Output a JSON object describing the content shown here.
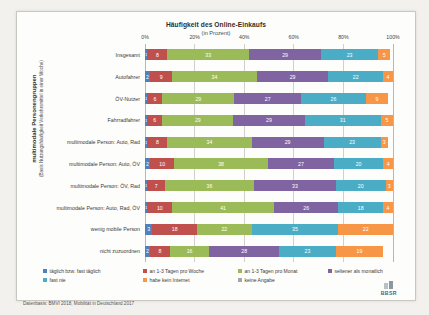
{
  "chart_data": {
    "type": "bar",
    "orientation": "horizontal",
    "stacked": true,
    "stack_unit": "percent",
    "title": "Häufigkeit des Online-Einkaufs",
    "subtitle": "(in Prozent)",
    "xlabel": "",
    "ylabel_line1": "multimodale Personengruppen",
    "ylabel_line2": "(Basis Nutzungshäufigkeit Verkehrsmittel in einer Woche)",
    "xlim": [
      0,
      100
    ],
    "xticks": [
      0,
      20,
      40,
      60,
      80,
      100
    ],
    "xticklabels": [
      "0%",
      "20%",
      "40%",
      "60%",
      "80%",
      "100%"
    ],
    "grid": true,
    "legend_position": "bottom",
    "categories": [
      "Insgesamt",
      "Autofahrer",
      "ÖV-Nutzer",
      "Fahrradfahrer",
      "multimodale Person: Auto, Rad",
      "multimodale Person: Auto, ÖV",
      "multimodale Person: ÖV, Rad",
      "multimodale Person: Auto, Rad, ÖV",
      "wenig mobile Person",
      "nicht zuzuordnen"
    ],
    "series": [
      {
        "name": "täglich bzw. fast täglich",
        "color": "#4f81bd",
        "values": [
          1,
          2,
          1,
          1,
          1,
          2,
          1,
          1,
          3,
          2
        ]
      },
      {
        "name": "an 1-3 Tagen pro Woche",
        "color": "#c0504d",
        "values": [
          8,
          9,
          6,
          6,
          8,
          10,
          7,
          10,
          18,
          8
        ]
      },
      {
        "name": "an 1-3 Tagen pro Monat",
        "color": "#9bbb59",
        "values": [
          33,
          34,
          29,
          29,
          34,
          38,
          36,
          41,
          22,
          16
        ]
      },
      {
        "name": "seltener als monatlich",
        "color": "#8064a2",
        "values": [
          29,
          29,
          27,
          29,
          29,
          27,
          33,
          26,
          0,
          28
        ]
      },
      {
        "name": "fast nie",
        "color": "#4bacc6",
        "values": [
          23,
          22,
          26,
          31,
          23,
          20,
          20,
          18,
          35,
          23
        ]
      },
      {
        "name": "habe kein Internet",
        "color": "#f79646",
        "values": [
          5,
          4,
          9,
          5,
          3,
          4,
          3,
          4,
          22,
          19
        ]
      },
      {
        "name": "keine Angabe",
        "color": "#a6a6a6",
        "values": [
          0,
          0,
          0,
          0,
          0,
          0,
          0,
          0,
          0,
          0
        ]
      }
    ],
    "labels_shown": {
      "Insgesamt": [
        "1",
        "8",
        "33",
        "29",
        "23",
        "5"
      ],
      "Autofahrer": [
        "2",
        "9",
        "34",
        "29",
        "22",
        "4"
      ],
      "ÖV-Nutzer": [
        "1",
        "6",
        "29",
        "27",
        "26",
        "9"
      ],
      "Fahrradfahrer": [
        "1",
        "6",
        "29",
        "29",
        "31",
        "5"
      ],
      "multimodale Person: Auto, Rad": [
        "1",
        "8",
        "34",
        "29",
        "23",
        "3"
      ],
      "multimodale Person: Auto, ÖV": [
        "2",
        "10",
        "38",
        "27",
        "20",
        "4"
      ],
      "multimodale Person: ÖV, Rad": [
        "1",
        "7",
        "36",
        "33",
        "20",
        "3"
      ],
      "multimodale Person: Auto, Rad, ÖV": [
        "1",
        "10",
        "41",
        "26",
        "18",
        "4"
      ],
      "wenig mobile Person": [
        "3",
        "18",
        "22",
        "35",
        "22"
      ],
      "nicht zuzuordnen": [
        "2",
        "8",
        "16",
        "28",
        "23",
        "19"
      ]
    }
  },
  "legend": {
    "items": [
      {
        "label": "täglich bzw. fast täglich",
        "color": "#4f81bd"
      },
      {
        "label": "an 1-3 Tagen pro Woche",
        "color": "#c0504d"
      },
      {
        "label": "an 1-3 Tagen pro Monat",
        "color": "#9bbb59"
      },
      {
        "label": "seltener als monatlich",
        "color": "#8064a2"
      },
      {
        "label": "fast nie",
        "color": "#4bacc6"
      },
      {
        "label": "habe kein Internet",
        "color": "#f79646"
      },
      {
        "label": "keine Angabe",
        "color": "#a6a6a6"
      }
    ]
  },
  "footer": {
    "source": "Datenbasis: BMVI 2018, Mobilität in Deutschland 2017",
    "logo_text": "BBSR"
  }
}
